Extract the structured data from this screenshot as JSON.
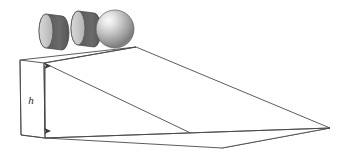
{
  "figure": {
    "name": "inclined-plane-with-rolling-objects",
    "background_color": "#ffffff",
    "width": 345,
    "height": 159
  },
  "labels": {
    "height_label": "h"
  },
  "annotations": {
    "height_dimension": {
      "label": "h",
      "style": "double-headed-vertical-arrow",
      "color": "#3a3a3a",
      "x": 45,
      "y_top": 62,
      "y_bottom": 135
    }
  },
  "ramp": {
    "name": "wedge",
    "outline_color": "#4a4a4a",
    "fill_color": "#ffffff",
    "stroke_width": 0.9,
    "vertices": {
      "back_top_left": [
        20,
        60
      ],
      "front_top_left": [
        44,
        63
      ],
      "apex_top": [
        136,
        47
      ],
      "right_tip": [
        330,
        128
      ],
      "front_bottom": [
        222,
        148
      ],
      "back_bottom_left": [
        21,
        135
      ],
      "front_bottom_left": [
        45,
        138
      ]
    }
  },
  "objects": [
    {
      "name": "cylinder-1",
      "type": "cylinder",
      "cx": 46,
      "cy": 31,
      "rx": 7,
      "ry": 17,
      "depth": 16,
      "face_color": "#c9c9c9",
      "side_color": "#565656",
      "edge_color": "#4a4a4a"
    },
    {
      "name": "cylinder-2",
      "type": "cylinder",
      "cx": 78,
      "cy": 28,
      "rx": 7,
      "ry": 17,
      "depth": 16,
      "face_color": "#c9c9c9",
      "side_color": "#565656",
      "edge_color": "#4a4a4a"
    },
    {
      "name": "sphere",
      "type": "sphere",
      "cx": 115,
      "cy": 29,
      "r": 19,
      "highlight_color": "#f2f2f2",
      "mid_color": "#b4b4b4",
      "shadow_color": "#6e6e6e",
      "edge_color": "#5a5a5a"
    }
  ],
  "colors": {
    "line": "#4a4a4a",
    "arrow": "#3a3a3a",
    "light_gray": "#c9c9c9",
    "dark_gray": "#565656",
    "background": "#ffffff"
  }
}
